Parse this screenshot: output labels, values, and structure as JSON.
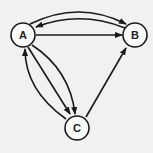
{
  "diagram": {
    "type": "directed-graph",
    "background": "#f1f1f1",
    "stroke_color": "#1a1a1a",
    "nodes": [
      {
        "id": "A",
        "label": "A",
        "x": 23,
        "y": 35
      },
      {
        "id": "B",
        "label": "B",
        "x": 135,
        "y": 35
      },
      {
        "id": "C",
        "label": "C",
        "x": 77,
        "y": 128
      }
    ],
    "edges": [
      {
        "from": "A",
        "to": "B",
        "shape": "curved-upper"
      },
      {
        "from": "B",
        "to": "A",
        "shape": "curved-lower"
      },
      {
        "from": "A",
        "to": "B",
        "shape": "straight"
      },
      {
        "from": "A",
        "to": "C",
        "shape": "straight"
      },
      {
        "from": "A",
        "to": "C",
        "shape": "curved-right"
      },
      {
        "from": "C",
        "to": "A",
        "shape": "curved-left"
      },
      {
        "from": "C",
        "to": "B",
        "shape": "straight"
      }
    ]
  }
}
